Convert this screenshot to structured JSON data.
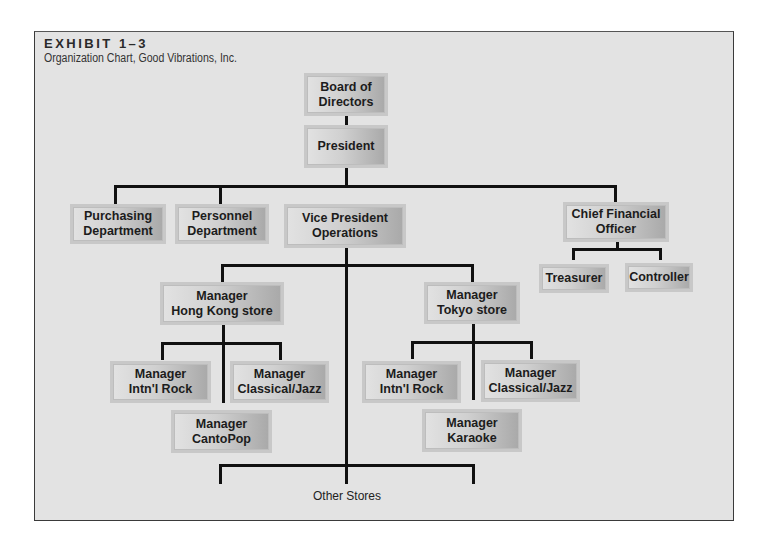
{
  "header": {
    "exhibit": "EXHIBIT 1–3",
    "subtitle": "Organization Chart, Good Vibrations, Inc."
  },
  "nodes": {
    "board": "Board of\nDirectors",
    "president": "President",
    "purchasing": "Purchasing\nDepartment",
    "personnel": "Personnel\nDepartment",
    "vp_operations": "Vice President\nOperations",
    "cfo": "Chief Financial\nOfficer",
    "treasurer": "Treasurer",
    "controller": "Controller",
    "hk_store": "Manager\nHong Kong store",
    "hk_rock": "Manager\nIntn'l Rock",
    "hk_jazz": "Manager\nClassical/Jazz",
    "hk_cantopop": "Manager\nCantoPop",
    "tokyo_store": "Manager\nTokyo store",
    "tokyo_rock": "Manager\nIntn'l Rock",
    "tokyo_jazz": "Manager\nClassical/Jazz",
    "tokyo_karaoke": "Manager\nKaraoke"
  },
  "footer_label": "Other Stores",
  "hierarchy": {
    "Board of Directors": [
      "President"
    ],
    "President": [
      "Purchasing Department",
      "Personnel Department",
      "Vice President Operations",
      "Chief Financial Officer"
    ],
    "Chief Financial Officer": [
      "Treasurer",
      "Controller"
    ],
    "Vice President Operations": [
      "Manager Hong Kong store",
      "Manager Tokyo store",
      "Other Stores"
    ],
    "Manager Hong Kong store": [
      "Manager Intn'l Rock",
      "Manager Classical/Jazz",
      "Manager CantoPop"
    ],
    "Manager Tokyo store": [
      "Manager Intn'l Rock",
      "Manager Classical/Jazz",
      "Manager Karaoke"
    ]
  },
  "colors": {
    "background": "#e3e3e3",
    "box_light": "#e2e2e2",
    "box_dark": "#a9a9a9",
    "connector": "#111111"
  }
}
